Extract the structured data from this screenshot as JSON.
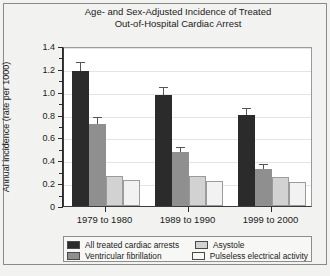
{
  "chart_data": {
    "type": "bar",
    "title": "Age- and Sex-Adjusted Incidence of Treated Out-of-Hospital Cardiac Arrest",
    "title_line1": "Age- and Sex-Adjusted Incidence of Treated",
    "title_line2": "Out-of-Hospital Cardiac Arrest",
    "xlabel": "",
    "ylabel": "Annual incidence (rate per 1000)",
    "categories": [
      "1979 to 1980",
      "1989 to 1990",
      "1999 to 2000"
    ],
    "ylim": [
      0,
      1.4
    ],
    "yticks": [
      0,
      0.2,
      0.4,
      0.6,
      0.8,
      1.0,
      1.2,
      1.4
    ],
    "ytick_labels": [
      "0",
      "0.2",
      "0.4",
      "0.6",
      "0.8",
      "1.0",
      "1.2",
      "1.4"
    ],
    "grid": true,
    "legend_position": "below-axes",
    "series": [
      {
        "name": "All treated cardiac arrests",
        "color": "#2b2b2b",
        "values": [
          1.18,
          0.97,
          0.8
        ],
        "errors": [
          0.07,
          0.06,
          0.05
        ]
      },
      {
        "name": "Ventricular fibrillation",
        "color": "#8f8f8f",
        "values": [
          0.72,
          0.47,
          0.32
        ],
        "errors": [
          0.05,
          0.04,
          0.04
        ]
      },
      {
        "name": "Asystole",
        "color": "#d2d2d2",
        "values": [
          0.26,
          0.26,
          0.25
        ],
        "errors": [
          0,
          0,
          0
        ]
      },
      {
        "name": "Pulseless electrical activity",
        "color": "#f2f2f2",
        "values": [
          0.23,
          0.22,
          0.21
        ],
        "errors": [
          0,
          0,
          0
        ]
      }
    ]
  },
  "legend": {
    "items": [
      {
        "label": "All treated cardiac arrests",
        "color": "#2b2b2b"
      },
      {
        "label": "Asystole",
        "color": "#d2d2d2"
      },
      {
        "label": "Ventricular fibrillation",
        "color": "#8f8f8f"
      },
      {
        "label": "Pulseless electrical activity",
        "color": "#f7f7f5"
      }
    ]
  }
}
